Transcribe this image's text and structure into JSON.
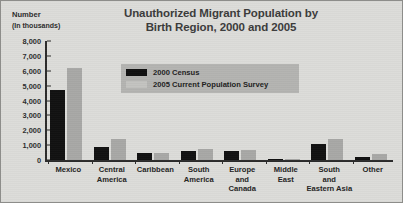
{
  "chart_data": {
    "type": "bar",
    "title": "Unauthorized Migrant Population by\nBirth Region, 2000 and 2005",
    "title_line1": "Unauthorized Migrant Population by",
    "title_line2": "Birth Region, 2000 and 2005",
    "xlabel": "",
    "ylabel": "Number",
    "ylabel_line1": "Number",
    "ylabel_line2": "(In thousands)",
    "ylim": [
      0,
      8000
    ],
    "ytick_values": [
      0,
      1000,
      2000,
      3000,
      4000,
      5000,
      6000,
      7000,
      8000
    ],
    "ytick_labels": [
      "0",
      "1,000",
      "2,000",
      "3,000",
      "4,000",
      "5,000",
      "6,000",
      "7,000",
      "8,000"
    ],
    "grid": false,
    "legend_position": "upper center",
    "categories": [
      "Mexico",
      "Central\nAmerica",
      "Caribbean",
      "South\nAmerica",
      "Europe\nand\nCanada",
      "Middle\nEast",
      "South\nand\nEastern Asia",
      "Other"
    ],
    "series": [
      {
        "name": "2000 Census",
        "color": "#111111",
        "values": [
          4700,
          900,
          450,
          600,
          600,
          100,
          1050,
          200
        ]
      },
      {
        "name": "2005 Current Population Survey",
        "color": "#a8a8a6",
        "values": [
          6200,
          1400,
          450,
          750,
          700,
          100,
          1400,
          400
        ]
      }
    ]
  },
  "colors": {
    "background": "#dcdcd9",
    "legend_background": "#b4b4b1",
    "axis": "#2b2b2b",
    "title_text": "#3b3b3b",
    "series_2000": "#111111",
    "series_2005": "#a8a8a6"
  }
}
